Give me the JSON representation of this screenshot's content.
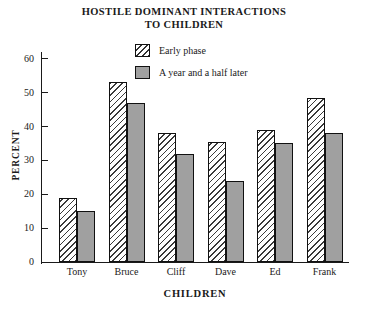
{
  "chart_data": {
    "type": "bar",
    "title": "HOSTILE DOMINANT INTERACTIONS TO CHILDREN",
    "title_lines": [
      "HOSTILE DOMINANT INTERACTIONS",
      "TO CHILDREN"
    ],
    "xlabel": "CHILDREN",
    "ylabel": "PERCENT",
    "categories": [
      "Tony",
      "Bruce",
      "Cliff",
      "Dave",
      "Ed",
      "Frank"
    ],
    "series": [
      {
        "name": "Early phase",
        "pattern": "diagonal-hatch",
        "color": "#ffffff",
        "values": [
          19,
          53,
          38,
          35.5,
          39,
          48.5
        ]
      },
      {
        "name": "A year and a half later",
        "pattern": "solid",
        "color": "#a0a0a0",
        "values": [
          15,
          47,
          32,
          24,
          35,
          38
        ]
      }
    ],
    "ylim": [
      0,
      62
    ],
    "yticks": [
      0,
      10,
      20,
      30,
      40,
      50,
      60
    ],
    "ytick_labels": [
      "0",
      "10",
      "20",
      "30",
      "40",
      "50",
      "60"
    ],
    "grid": false,
    "legend_position": "top-center"
  },
  "legend": {
    "items": [
      {
        "label": "Early phase",
        "swatch": "hatch-swatch"
      },
      {
        "label": "A year and a half later",
        "swatch": "solid-swatch"
      }
    ]
  }
}
